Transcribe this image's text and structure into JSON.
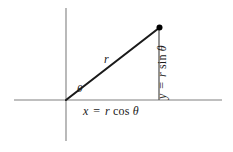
{
  "figure": {
    "background_color": "#ffffff",
    "axis_color": "#808080",
    "ray_color": "#1a1a1a",
    "point_color": "#000000",
    "labels": {
      "radius": {
        "var": "r"
      },
      "angle": {
        "symbol": "θ"
      },
      "x_equation": {
        "lhs": "x",
        "eq": "=",
        "coef": "r",
        "func": "cos",
        "arg": "θ",
        "full": "x = r cos θ"
      },
      "y_equation": {
        "lhs": "y",
        "eq": "=",
        "coef": "r",
        "func": "sin",
        "arg": "θ",
        "full": "y = r sin θ"
      }
    },
    "geometry": {
      "origin": {
        "x": 66,
        "y": 100
      },
      "point": {
        "x": 159,
        "y": 28
      },
      "x_axis": {
        "x1": 14,
        "y1": 100,
        "x2": 222,
        "y2": 100
      },
      "y_axis": {
        "x1": 66,
        "y1": 8,
        "x2": 66,
        "y2": 141
      },
      "drop_line": {
        "x1": 159,
        "y1": 28,
        "x2": 159,
        "y2": 100
      }
    }
  }
}
